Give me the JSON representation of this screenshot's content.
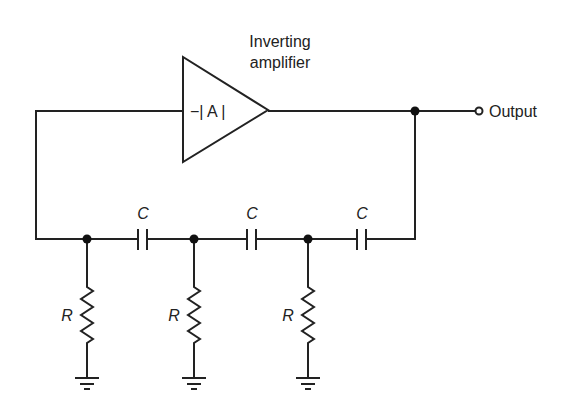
{
  "diagram": {
    "amplifier": {
      "label_line1": "Inverting",
      "label_line2": "amplifier",
      "gain": "−| A |"
    },
    "output_label": "Output",
    "capacitors": [
      {
        "label": "C"
      },
      {
        "label": "C"
      },
      {
        "label": "C"
      }
    ],
    "resistors": [
      {
        "label": "R"
      },
      {
        "label": "R"
      },
      {
        "label": "R"
      }
    ]
  }
}
